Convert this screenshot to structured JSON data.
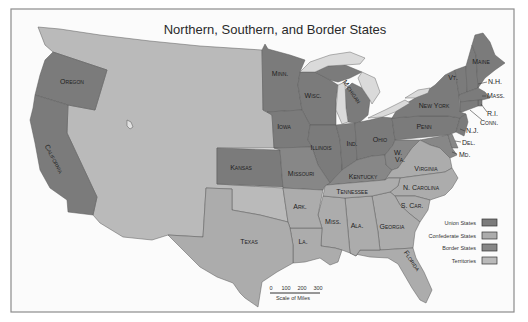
{
  "title": "Northern, Southern, and Border States",
  "colors": {
    "union": "#7b7b7b",
    "border": "#878787",
    "confederate": "#acacac",
    "territory": "#bababa",
    "water": "#dadada",
    "background": "#fbfbfb"
  },
  "territory_region": {
    "status": "territory"
  },
  "states": [
    {
      "name": "Oregon",
      "label": "Oregon",
      "status": "union"
    },
    {
      "name": "California",
      "label": "California",
      "status": "union"
    },
    {
      "name": "Kansas",
      "label": "Kansas",
      "status": "union"
    },
    {
      "name": "Minnesota",
      "label": "Minn.",
      "status": "union"
    },
    {
      "name": "Wisconsin",
      "label": "Wisc.",
      "status": "union"
    },
    {
      "name": "Michigan",
      "label": "Michigan",
      "status": "union"
    },
    {
      "name": "Iowa",
      "label": "Iowa",
      "status": "union"
    },
    {
      "name": "Illinois",
      "label": "Illinois",
      "status": "union"
    },
    {
      "name": "Indiana",
      "label": "Ind.",
      "status": "union"
    },
    {
      "name": "Ohio",
      "label": "Ohio",
      "status": "union"
    },
    {
      "name": "Pennsylvania",
      "label": "Penn",
      "status": "union"
    },
    {
      "name": "New York",
      "label": "New York",
      "status": "union"
    },
    {
      "name": "Vermont",
      "label": "Vt.",
      "status": "union"
    },
    {
      "name": "New Hampshire",
      "label": "N.H.",
      "status": "union"
    },
    {
      "name": "Maine",
      "label": "Maine",
      "status": "union"
    },
    {
      "name": "Massachusetts",
      "label": "Mass.",
      "status": "union"
    },
    {
      "name": "Rhode Island",
      "label": "R.I.",
      "status": "union"
    },
    {
      "name": "Connecticut",
      "label": "Conn.",
      "status": "union"
    },
    {
      "name": "New Jersey",
      "label": "N.J.",
      "status": "union"
    },
    {
      "name": "Missouri",
      "label": "Missouri",
      "status": "border"
    },
    {
      "name": "Kentucky",
      "label": "Kentucky",
      "status": "border"
    },
    {
      "name": "West Virginia",
      "label_lines": [
        "W.",
        "Va."
      ],
      "status": "border"
    },
    {
      "name": "Maryland",
      "label": "Md.",
      "status": "border"
    },
    {
      "name": "Delaware",
      "label": "Del.",
      "status": "border"
    },
    {
      "name": "Virginia",
      "label": "Virginia",
      "status": "confederate"
    },
    {
      "name": "North Carolina",
      "label": "N. Carolina",
      "status": "confederate"
    },
    {
      "name": "South Carolina",
      "label": "S. Car.",
      "status": "confederate"
    },
    {
      "name": "Georgia",
      "label": "Georgia",
      "status": "confederate"
    },
    {
      "name": "Florida",
      "label": "Florida",
      "status": "confederate"
    },
    {
      "name": "Alabama",
      "label": "Ala.",
      "status": "confederate"
    },
    {
      "name": "Mississippi",
      "label": "Miss.",
      "status": "confederate"
    },
    {
      "name": "Louisiana",
      "label": "La.",
      "status": "confederate"
    },
    {
      "name": "Arkansas",
      "label": "Ark.",
      "status": "confederate"
    },
    {
      "name": "Tennessee",
      "label": "Tennessee",
      "status": "confederate"
    },
    {
      "name": "Texas",
      "label": "Texas",
      "status": "confederate"
    }
  ],
  "legend": [
    {
      "label": "Union States",
      "status": "union"
    },
    {
      "label": "Confederate States",
      "status": "confederate"
    },
    {
      "label": "Border States",
      "status": "border"
    },
    {
      "label": "Territories",
      "status": "territory"
    }
  ],
  "scale": {
    "ticks": [
      "0",
      "100",
      "200",
      "300"
    ],
    "caption": "Scale of Miles"
  }
}
